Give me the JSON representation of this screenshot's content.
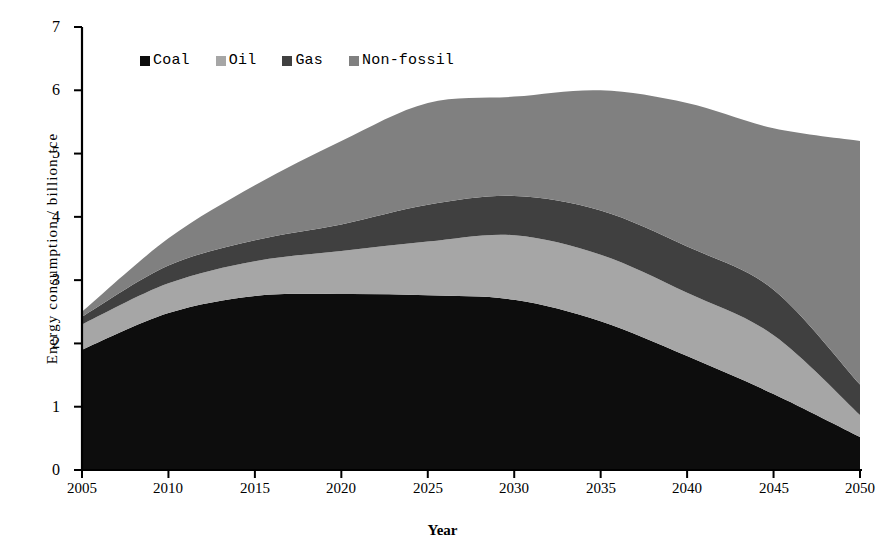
{
  "chart_data": {
    "type": "area",
    "stacked": true,
    "title": "",
    "xlabel": "Year",
    "ylabel": "Energy consumption / billion tce",
    "x": [
      2005,
      2010,
      2015,
      2020,
      2025,
      2030,
      2035,
      2040,
      2045,
      2050
    ],
    "categories": [
      "2005",
      "2010",
      "2015",
      "2020",
      "2025",
      "2030",
      "2035",
      "2040",
      "2045",
      "2050"
    ],
    "xlim": [
      2005,
      2050
    ],
    "ylim": [
      0,
      7
    ],
    "xticks": [
      "2005",
      "2010",
      "2015",
      "2020",
      "2025",
      "2030",
      "2035",
      "2040",
      "2045",
      "2050"
    ],
    "yticks": [
      "0",
      "1",
      "2",
      "3",
      "4",
      "5",
      "6",
      "7"
    ],
    "grid": false,
    "legend_position": "top-left-inside",
    "series": [
      {
        "name": "Coal",
        "color": "#0d0d0d",
        "values": [
          1.9,
          2.48,
          2.75,
          2.78,
          2.76,
          2.69,
          2.35,
          1.8,
          1.2,
          0.52
        ]
      },
      {
        "name": "Oil",
        "color": "#a6a6a6",
        "values": [
          0.4,
          0.47,
          0.55,
          0.68,
          0.85,
          1.02,
          1.05,
          1.0,
          0.93,
          0.35
        ]
      },
      {
        "name": "Gas",
        "color": "#404040",
        "values": [
          0.12,
          0.28,
          0.33,
          0.42,
          0.58,
          0.62,
          0.7,
          0.73,
          0.72,
          0.48
        ]
      },
      {
        "name": "Non-fossil",
        "color": "#808080",
        "values": [
          0.08,
          0.43,
          0.87,
          1.32,
          1.61,
          1.57,
          1.9,
          2.27,
          2.55,
          3.85
        ]
      }
    ],
    "totals": [
      2.5,
      3.66,
      4.5,
      5.2,
      5.8,
      5.9,
      6.0,
      5.8,
      5.4,
      5.2
    ]
  },
  "axes": {
    "y_title": "Energy consumption / billion tce",
    "x_title": "Year",
    "y_ticks": [
      "7",
      "6",
      "5",
      "4",
      "3",
      "2",
      "1",
      "0"
    ],
    "x_ticks": [
      "2005",
      "2010",
      "2015",
      "2020",
      "2025",
      "2030",
      "2035",
      "2040",
      "2045",
      "2050"
    ]
  },
  "legend": {
    "items": [
      {
        "label": "Coal",
        "color": "#0d0d0d"
      },
      {
        "label": "Oil",
        "color": "#a6a6a6"
      },
      {
        "label": "Gas",
        "color": "#404040"
      },
      {
        "label": "Non-fossil",
        "color": "#808080"
      }
    ]
  }
}
